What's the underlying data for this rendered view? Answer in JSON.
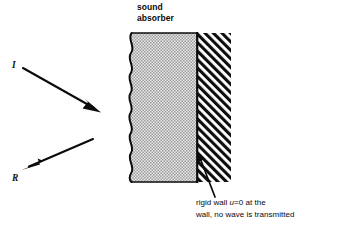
{
  "figure": {
    "background_color": "#ffffff",
    "ink_color": "#0b0b0b"
  },
  "labels": {
    "sound_absorber_line1": "sound",
    "sound_absorber_line2": "absorber",
    "incident_ray": "I",
    "reflected_ray": "R"
  },
  "caption": {
    "line1_before_italic": "rigid wall ",
    "line1_italic": "u",
    "line1_after_italic": "=0 at the",
    "line2": "wall, no wave is transmitted"
  },
  "regions": {
    "absorber": {
      "name": "sound absorber",
      "fill": "stipple-dots",
      "fill_color": "#cfcfcf",
      "left_edge": "wavy"
    },
    "rigid_wall": {
      "name": "rigid wall",
      "fill": "diagonal-hatch",
      "fill_color": "#111111"
    }
  },
  "arrows": {
    "incident": {
      "from_x": 23,
      "from_y": 68,
      "to_x": 99,
      "to_y": 111
    },
    "reflected": {
      "from_x": 93,
      "from_y": 139,
      "to_x": 23,
      "to_y": 169
    },
    "wall_pointer": {
      "from_x": 214,
      "from_y": 196,
      "to_x": 197,
      "to_y": 152
    }
  }
}
